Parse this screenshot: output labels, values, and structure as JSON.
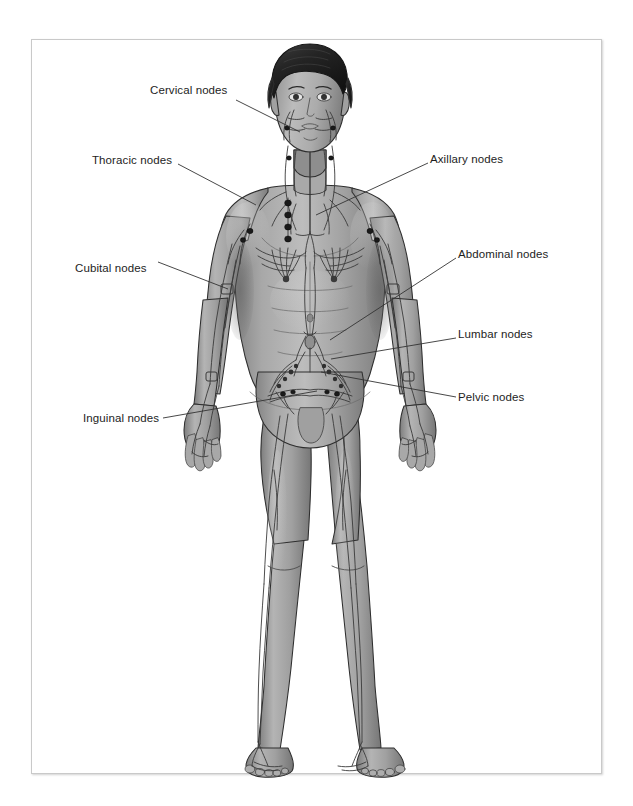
{
  "figure": {
    "view": "anterior",
    "frame": {
      "border_color": "#c9c9c9",
      "background": "#ffffff"
    },
    "palette": {
      "skin_light": "#bdbdbd",
      "skin_mid": "#9d9d9d",
      "skin_shadow": "#7c7c7c",
      "skin_deep_shadow": "#666666",
      "hair_dark": "#2b2b2b",
      "hair_mid": "#4a4a4a",
      "vessel": "#3a3a3a",
      "node_fill": "#1a1a1a",
      "outline": "#2e2e2e",
      "leader_line": "#333333",
      "label_text": "#1d1d1d"
    }
  },
  "labels": [
    {
      "id": "cervical",
      "text": "Cervical nodes",
      "x": 150,
      "y": 90,
      "align": "left",
      "line": [
        [
          236,
          100
        ],
        [
          300,
          132
        ]
      ]
    },
    {
      "id": "thoracic",
      "text": "Thoracic nodes",
      "x": 92,
      "y": 154,
      "align": "left",
      "line": [
        [
          178,
          164
        ],
        [
          256,
          205
        ]
      ]
    },
    {
      "id": "axillary",
      "text": "Axillary nodes",
      "x": 430,
      "y": 153,
      "align": "left",
      "line": [
        [
          428,
          163
        ],
        [
          316,
          215
        ]
      ]
    },
    {
      "id": "cubital",
      "text": "Cubital nodes",
      "x": 75,
      "y": 262,
      "align": "left",
      "line": [
        [
          158,
          272
        ],
        [
          228,
          289
        ]
      ]
    },
    {
      "id": "abdominal",
      "text": "Abdominal nodes",
      "x": 458,
      "y": 248,
      "align": "left",
      "line": [
        [
          456,
          258
        ],
        [
          330,
          340
        ]
      ]
    },
    {
      "id": "lumbar",
      "text": "Lumbar nodes",
      "x": 458,
      "y": 328,
      "align": "left",
      "line": [
        [
          456,
          338
        ],
        [
          331,
          359
        ]
      ]
    },
    {
      "id": "pelvic",
      "text": "Pelvic nodes",
      "x": 458,
      "y": 391,
      "align": "left",
      "line": [
        [
          456,
          397
        ],
        [
          321,
          372
        ]
      ]
    },
    {
      "id": "inguinal",
      "text": "Inguinal nodes",
      "x": 83,
      "y": 412,
      "align": "left",
      "line": [
        [
          163,
          418
        ],
        [
          317,
          391
        ]
      ]
    }
  ],
  "node_groups": [
    {
      "name": "Cervical nodes",
      "region": "neck and sides of face, both sides"
    },
    {
      "name": "Thoracic nodes",
      "region": "upper chest beside the sternum, both sides"
    },
    {
      "name": "Axillary nodes",
      "region": "armpits, both sides"
    },
    {
      "name": "Cubital nodes",
      "region": "inner elbows, both arms"
    },
    {
      "name": "Abdominal nodes",
      "region": "central abdomen near the cisterna chyli"
    },
    {
      "name": "Lumbar nodes",
      "region": "lower back / lumbar trunk, midline"
    },
    {
      "name": "Pelvic nodes",
      "region": "pelvic brim, both sides"
    },
    {
      "name": "Inguinal nodes",
      "region": "groin creases, both sides"
    }
  ]
}
